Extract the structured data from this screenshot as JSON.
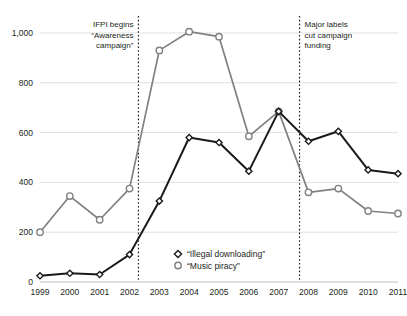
{
  "chart_data": {
    "type": "line",
    "title": "",
    "subtitle": "",
    "xlabel": "",
    "ylabel": "",
    "x": [
      1999,
      2000,
      2001,
      2002,
      2003,
      2004,
      2005,
      2006,
      2007,
      2008,
      2009,
      2010,
      2011
    ],
    "categories": [
      "1999",
      "2000",
      "2001",
      "2002",
      "2003",
      "2004",
      "2005",
      "2006",
      "2007",
      "2008",
      "2009",
      "2010",
      "2011"
    ],
    "xlim": [
      1999,
      2011
    ],
    "ylim": [
      0,
      1060
    ],
    "yticks": [
      0,
      200,
      400,
      600,
      800,
      1000
    ],
    "ytick_labels": [
      "0",
      "200",
      "400",
      "600",
      "800",
      "1,000"
    ],
    "grid": "horizontal",
    "legend_position": "bottom-center",
    "series": [
      {
        "name": "“Illegal downloading”",
        "marker": "diamond",
        "color": "#1a1a1a",
        "values": [
          25,
          35,
          30,
          110,
          325,
          580,
          560,
          445,
          685,
          565,
          605,
          450,
          435
        ]
      },
      {
        "name": "“Music piracy”",
        "marker": "circle",
        "color": "#808080",
        "values": [
          200,
          345,
          250,
          375,
          930,
          1005,
          985,
          585,
          685,
          360,
          375,
          285,
          275
        ]
      }
    ],
    "annotations": [
      {
        "id": "ifpi-campaign",
        "x": 2002.3,
        "align": "right",
        "lines": [
          "IFPI begins",
          "“Awareness",
          "campaign”"
        ]
      },
      {
        "id": "major-labels-cut",
        "x": 2007.7,
        "align": "left",
        "lines": [
          "Major labels",
          "cut campaign",
          "funding"
        ]
      }
    ]
  }
}
